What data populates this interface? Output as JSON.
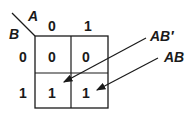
{
  "kmap": {
    "var_col": "A",
    "var_row": "B",
    "col_headers": [
      "0",
      "1"
    ],
    "row_headers": [
      "0",
      "1"
    ],
    "cells": [
      [
        "0",
        "0"
      ],
      [
        "1",
        "1"
      ]
    ]
  },
  "annotations": [
    {
      "label": "AB′",
      "points_to": "cell B=1,A=0"
    },
    {
      "label": "AB",
      "points_to": "cell B=1,A=1"
    }
  ]
}
